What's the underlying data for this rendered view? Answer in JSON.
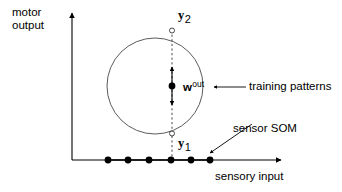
{
  "figure": {
    "kind": "schematic-diagram",
    "background_color": "#ffffff",
    "stroke_color": "#000000",
    "thin_stroke_color": "#333333"
  },
  "axes": {
    "y_axis": {
      "name": "motor-output-axis",
      "label_line1": "motor",
      "label_line2": "output"
    },
    "x_axis": {
      "name": "sensory-input-axis",
      "label": "sensory input"
    }
  },
  "circle": {
    "name": "training-pattern-circle",
    "center_x": 155,
    "center_y": 86,
    "radius": 48
  },
  "markers": {
    "top": {
      "label_base": "y",
      "label_sub": "2"
    },
    "bottom": {
      "label_base": "y",
      "label_sub": "1"
    },
    "center": {
      "label_base": "w",
      "label_sup": "out"
    }
  },
  "som": {
    "name": "sensor-som-line",
    "node_count": 6,
    "node_positions_x": [
      108,
      128,
      149,
      171,
      191,
      210
    ],
    "node_y": 160
  },
  "callouts": {
    "training_patterns": "training patterns",
    "sensor_som": "sensor SOM"
  }
}
